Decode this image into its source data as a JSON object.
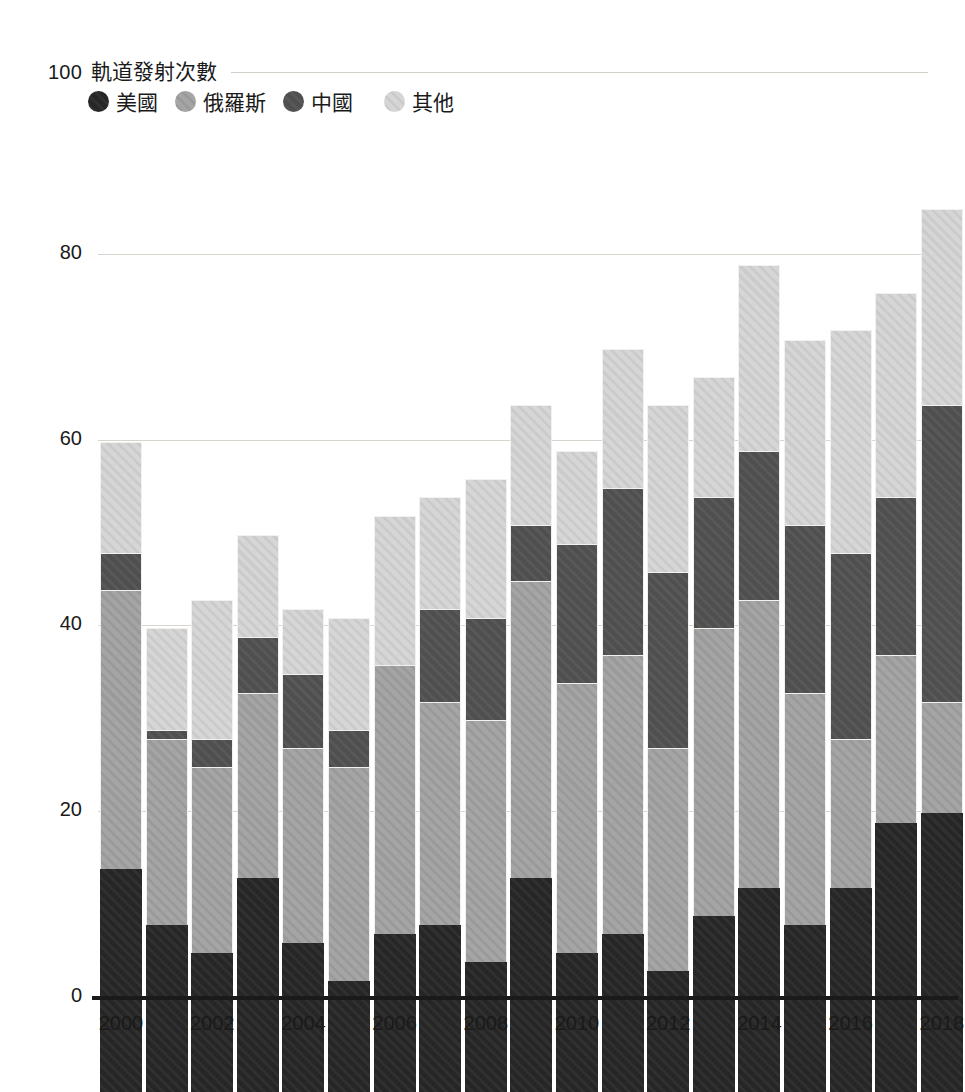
{
  "header": {
    "top_tick": "100",
    "title": "軌道發射次數"
  },
  "legend": {
    "items": [
      {
        "label": "美國",
        "color": "#2b2b2b"
      },
      {
        "label": "俄羅斯",
        "color": "#a5a5a5"
      },
      {
        "label": "中國",
        "color": "#4f4f4f"
      },
      {
        "label": "其他",
        "color": "#d6d6d6"
      }
    ]
  },
  "axes": {
    "y_ticks": [
      "0",
      "20",
      "40",
      "60",
      "80",
      "100"
    ],
    "x_ticks": [
      "2000",
      "2002",
      "2004",
      "2006",
      "2008",
      "2010",
      "2012",
      "2014",
      "2016",
      "2018"
    ]
  },
  "chart_data": {
    "type": "bar",
    "subtype": "stacked-vertical",
    "title": "軌道發射次數",
    "xlabel": "",
    "ylabel": "軌道發射次數",
    "ylim": [
      0,
      100
    ],
    "ytick_values": [
      0,
      20,
      40,
      60,
      80,
      100
    ],
    "grid": "horizontal",
    "legend_position": "top-left",
    "stack_order_bottom_to_top": [
      "美國",
      "俄羅斯",
      "中國",
      "其他"
    ],
    "categories": [
      "2000",
      "2001",
      "2002",
      "2003",
      "2004",
      "2005",
      "2006",
      "2007",
      "2008",
      "2009",
      "2010",
      "2011",
      "2012",
      "2013",
      "2014",
      "2015",
      "2016",
      "2017",
      "2018"
    ],
    "series": [
      {
        "name": "美國",
        "color": "#2b2b2b",
        "values": [
          24,
          18,
          15,
          23,
          16,
          12,
          17,
          18,
          14,
          23,
          15,
          17,
          13,
          19,
          22,
          18,
          22,
          29,
          30
        ]
      },
      {
        "name": "俄羅斯",
        "color": "#a5a5a5",
        "values": [
          30,
          20,
          20,
          20,
          21,
          23,
          29,
          24,
          26,
          32,
          29,
          30,
          24,
          31,
          31,
          25,
          16,
          18,
          12
        ]
      },
      {
        "name": "中國",
        "color": "#4f4f4f",
        "values": [
          4,
          1,
          3,
          6,
          8,
          4,
          0,
          10,
          11,
          6,
          15,
          18,
          19,
          14,
          16,
          18,
          20,
          17,
          32
        ]
      },
      {
        "name": "其他",
        "color": "#d6d6d6",
        "values": [
          12,
          11,
          15,
          11,
          7,
          12,
          16,
          12,
          15,
          13,
          10,
          15,
          18,
          13,
          20,
          20,
          24,
          22,
          21
        ]
      }
    ],
    "totals": [
      70,
      50,
      53,
      60,
      52,
      51,
      62,
      64,
      66,
      74,
      69,
      80,
      74,
      77,
      89,
      81,
      82,
      86,
      95
    ]
  },
  "style": {
    "background": "#ffffff",
    "gridline_color": "#d8d5cf",
    "axis_color": "#1a1a1a",
    "segment_border": "#f2f1ee"
  }
}
